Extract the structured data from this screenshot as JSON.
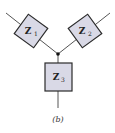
{
  "diagram": {
    "type": "wye-impedance-network",
    "impedances": [
      {
        "id": "z1",
        "label": "Z",
        "subscript": "1"
      },
      {
        "id": "z2",
        "label": "Z",
        "subscript": "2"
      },
      {
        "id": "z3",
        "label": "Z",
        "subscript": "3"
      }
    ],
    "caption": "(b)",
    "colors": {
      "box_fill": "#d9d9e6",
      "box_stroke": "#2b2b2b",
      "wire": "#555555",
      "node": "#111111"
    }
  }
}
